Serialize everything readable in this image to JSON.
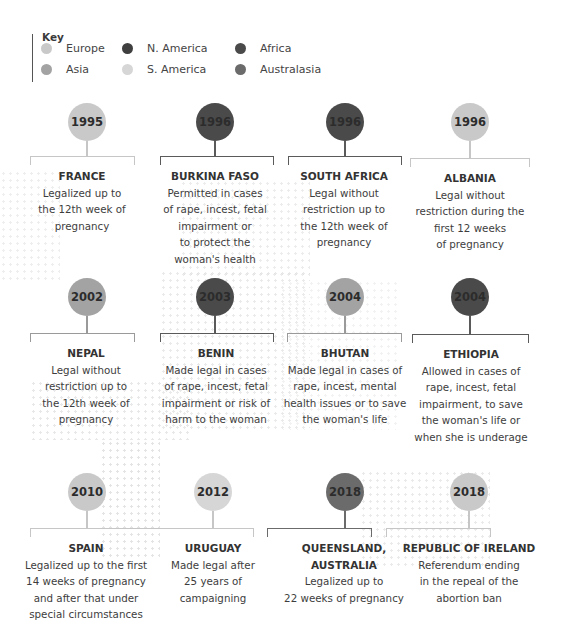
{
  "key": {
    "title": "Key",
    "items": [
      {
        "label": "Europe",
        "color": "#c9c9c9"
      },
      {
        "label": "Asia",
        "color": "#a3a3a3"
      },
      {
        "label": "N. America",
        "color": "#3f3f3f"
      },
      {
        "label": "S. America",
        "color": "#d6d6d6"
      },
      {
        "label": "Africa",
        "color": "#4a4a4a"
      },
      {
        "label": "Australasia",
        "color": "#6b6b6b"
      }
    ]
  },
  "timeline": [
    {
      "year": "1995",
      "country": "FRANCE",
      "region": "Europe",
      "color": "#c9c9c9",
      "line": "#c6c6c6",
      "description": "Legalized up to\nthe 12th week of\npregnancy"
    },
    {
      "year": "1996",
      "country": "BURKINA FASO",
      "region": "Africa",
      "color": "#4a4a4a",
      "line": "#5a5a5a",
      "description": "Permitted in cases\nof rape, incest, fetal\nimpairment or\nto protect the\nwoman's health"
    },
    {
      "year": "1996",
      "country": "SOUTH AFRICA",
      "region": "Africa",
      "color": "#4a4a4a",
      "line": "#5a5a5a",
      "description": "Legal without\nrestriction up to\nthe 12th week of\npregnancy"
    },
    {
      "year": "1996",
      "country": "ALBANIA",
      "region": "Europe",
      "color": "#c9c9c9",
      "line": "#c6c6c6",
      "description": "Legal without\nrestriction during the\nfirst 12 weeks\nof pregnancy"
    },
    {
      "year": "2002",
      "country": "NEPAL",
      "region": "Asia",
      "color": "#a3a3a3",
      "line": "#9a9a9a",
      "description": "Legal without\nrestriction up to\nthe 12th week of\npregnancy"
    },
    {
      "year": "2003",
      "country": "BENIN",
      "region": "Africa",
      "color": "#4a4a4a",
      "line": "#5a5a5a",
      "description": "Made legal in cases\nof rape, incest, fetal\nimpairment or risk of\nharm to the woman"
    },
    {
      "year": "2004",
      "country": "BHUTAN",
      "region": "Asia",
      "color": "#a3a3a3",
      "line": "#9a9a9a",
      "description": "Made legal in cases of\nrape, incest, mental\nhealth issues or to save\nthe woman's life"
    },
    {
      "year": "2004",
      "country": "ETHIOPIA",
      "region": "Africa",
      "color": "#4a4a4a",
      "line": "#5a5a5a",
      "description": "Allowed in cases of\nrape, incest, fetal\nimpairment, to save\nthe woman's life or\nwhen she is underage"
    },
    {
      "year": "2010",
      "country": "SPAIN",
      "region": "Europe",
      "color": "#c9c9c9",
      "line": "#c6c6c6",
      "description": "Legalized up to the first\n14 weeks of pregnancy\nand after that under\nspecial circumstances"
    },
    {
      "year": "2012",
      "country": "URUGUAY",
      "region": "S. America",
      "color": "#d6d6d6",
      "line": "#c6c6c6",
      "description": "Made legal after\n25 years of\ncampaigning"
    },
    {
      "year": "2018",
      "country": "QUEENSLAND,\nAUSTRALIA",
      "region": "Australasia",
      "color": "#6b6b6b",
      "line": "#6b6b6b",
      "description": "Legalized up to\n22 weeks of pregnancy"
    },
    {
      "year": "2018",
      "country": "REPUBLIC OF IRELAND",
      "region": "Europe",
      "color": "#c9c9c9",
      "line": "#c6c6c6",
      "description": "Referendum ending\nin the repeal of the\nabortion ban"
    }
  ]
}
